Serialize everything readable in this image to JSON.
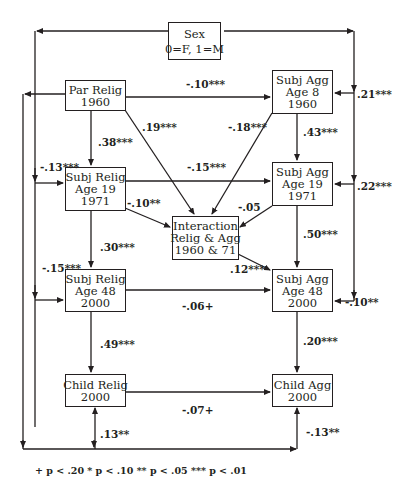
{
  "diagram": {
    "type": "path-model",
    "nodes": {
      "sex": {
        "lines": [
          "Sex",
          "0=F, 1=M"
        ]
      },
      "par_relig": {
        "lines": [
          "Par Relig",
          "1960"
        ]
      },
      "subj_agg_8": {
        "lines": [
          "Subj Agg",
          "Age 8",
          "1960"
        ]
      },
      "subj_relig_19": {
        "lines": [
          "Subj Relig",
          "Age 19",
          "1971"
        ]
      },
      "subj_agg_19": {
        "lines": [
          "Subj Agg",
          "Age 19",
          "1971"
        ]
      },
      "interaction": {
        "lines": [
          "Interaction",
          "Relig & Agg",
          "1960 & 71"
        ]
      },
      "subj_relig_48": {
        "lines": [
          "Subj Relig",
          "Age 48",
          "2000"
        ]
      },
      "subj_agg_48": {
        "lines": [
          "Subj Agg",
          "Age 48",
          "2000"
        ]
      },
      "child_relig": {
        "lines": [
          "Child Relig",
          "2000"
        ]
      },
      "child_agg": {
        "lines": [
          "Child Agg",
          "2000"
        ]
      }
    },
    "edges": {
      "par_relig_to_agg8": "-.10***",
      "par_relig_to_relig19": ".38***",
      "par_relig_to_interaction": ".19***",
      "agg8_to_interaction": "-.18***",
      "agg8_to_agg19": ".43***",
      "sex_to_agg8": ".21***",
      "sex_to_relig19": "-.13***",
      "relig19_to_agg19": "-.15***",
      "sex_to_agg19": ".22***",
      "relig19_to_interaction": "-.10**",
      "agg19_to_interaction": "-.05",
      "relig19_to_relig48": ".30***",
      "agg19_to_agg48": ".50***",
      "sex_to_relig48": "-.15***",
      "interaction_to_agg48": ".12***",
      "relig48_to_agg48": "-.06+",
      "sex_to_agg48": "-.10**",
      "relig48_to_child_relig": ".49***",
      "agg48_to_child_agg": ".20***",
      "child_relig_to_child_agg": "-.07+",
      "sex_to_child_relig": ".13**",
      "sex_to_child_agg": "-.13**"
    },
    "legend": "+ p < .20  * p < .10  ** p < .05  *** p < .01"
  }
}
